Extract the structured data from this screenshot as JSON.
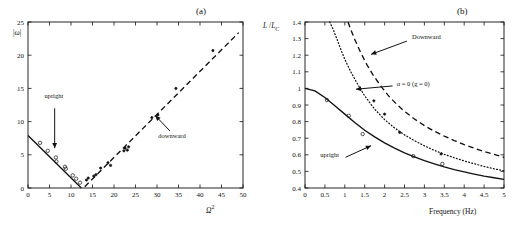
{
  "figure": {
    "panels": [
      {
        "id": "a",
        "label": "(a)",
        "chart_data": {
          "type": "scatter",
          "title": "",
          "xlabel": "Ω²",
          "ylabel": "|ω|",
          "xlim": [
            0,
            50
          ],
          "ylim": [
            0,
            25
          ],
          "xticks": [
            0,
            5,
            10,
            15,
            20,
            25,
            30,
            35,
            40,
            45,
            50
          ],
          "yticks": [
            0,
            5,
            10,
            15,
            20,
            25
          ],
          "grid": false,
          "legend": "none",
          "annotations": [
            {
              "text": "upright",
              "x": 6.0,
              "y": 13.5
            },
            {
              "text": "downward",
              "x": 33.5,
              "y": 7.5
            }
          ],
          "series": [
            {
              "name": "upright-fit",
              "style": "solid-line",
              "x": [
                0.0,
                12.4
              ],
              "values": [
                7.9,
                0.0
              ]
            },
            {
              "name": "downward-fit",
              "style": "dashed-line",
              "x": [
                13.2,
                49.0
              ],
              "values": [
                0.2,
                23.4
              ]
            },
            {
              "name": "upright-data",
              "style": "open-circle",
              "x": [
                2.8,
                4.6,
                6.5,
                6.6,
                8.6,
                8.8,
                10.4,
                11.2,
                12.1
              ],
              "values": [
                6.8,
                5.6,
                4.6,
                4.0,
                3.2,
                2.9,
                1.9,
                1.4,
                0.8
              ]
            },
            {
              "name": "downward-data",
              "style": "filled-dot",
              "x": [
                13.6,
                14.0,
                15.3,
                15.8,
                16.9,
                18.6,
                19.2,
                22.3,
                22.6,
                23.1,
                23.4,
                28.8,
                30.2,
                34.4,
                43.0
              ],
              "values": [
                1.2,
                1.5,
                1.8,
                2.0,
                3.0,
                3.8,
                3.4,
                5.6,
                6.0,
                5.7,
                6.2,
                10.6,
                11.0,
                15.0,
                20.7
              ]
            }
          ]
        }
      },
      {
        "id": "b",
        "label": "(b)",
        "chart_data": {
          "type": "line",
          "title": "",
          "xlabel": "Frequency (Hz)",
          "ylabel": "L /L_C",
          "xlim": [
            0,
            5
          ],
          "ylim": [
            0.4,
            1.4
          ],
          "xticks": [
            0,
            0.5,
            1,
            1.5,
            2,
            2.5,
            3,
            3.5,
            4,
            4.5,
            5
          ],
          "yticks": [
            0.4,
            0.5,
            0.6,
            0.7,
            0.8,
            0.9,
            1,
            1.1,
            1.2,
            1.3,
            1.4
          ],
          "grid": false,
          "legend": "none",
          "annotations": [
            {
              "text": "Downward",
              "x": 3.05,
              "y": 1.295
            },
            {
              "text": "α = 0 (g = 0)",
              "x": 2.72,
              "y": 1.015
            },
            {
              "text": "upright",
              "x": 0.62,
              "y": 0.585
            }
          ],
          "series": [
            {
              "name": "upright",
              "style": "solid-line",
              "x": [
                0,
                0.25,
                0.5,
                0.75,
                1,
                1.25,
                1.5,
                1.75,
                2,
                2.25,
                2.5,
                2.75,
                3,
                3.25,
                3.5,
                3.75,
                4,
                4.25,
                4.5,
                4.75,
                5
              ],
              "values": [
                1.0,
                0.985,
                0.945,
                0.895,
                0.845,
                0.795,
                0.748,
                0.708,
                0.672,
                0.64,
                0.612,
                0.588,
                0.565,
                0.545,
                0.527,
                0.511,
                0.497,
                0.484,
                0.472,
                0.462,
                0.452
              ]
            },
            {
              "name": "alpha-zero",
              "style": "dotted-line",
              "x": [
                0.62,
                0.7,
                0.8,
                0.9,
                1.0,
                1.15,
                1.3,
                1.5,
                1.75,
                2,
                2.25,
                2.5,
                2.75,
                3,
                3.25,
                3.5,
                3.75,
                4,
                4.25,
                4.5,
                4.75,
                5
              ],
              "values": [
                1.4,
                1.36,
                1.3,
                1.235,
                1.175,
                1.1,
                1.035,
                0.955,
                0.875,
                0.812,
                0.762,
                0.72,
                0.685,
                0.654,
                0.627,
                0.603,
                0.582,
                0.563,
                0.546,
                0.53,
                0.516,
                0.503
              ]
            },
            {
              "name": "downward",
              "style": "dashed-line",
              "x": [
                1.08,
                1.15,
                1.25,
                1.4,
                1.55,
                1.7,
                1.9,
                2.1,
                2.3,
                2.5,
                2.75,
                3,
                3.25,
                3.5,
                3.75,
                4,
                4.25,
                4.5,
                4.75,
                5
              ],
              "values": [
                1.4,
                1.355,
                1.295,
                1.215,
                1.145,
                1.085,
                1.015,
                0.955,
                0.905,
                0.862,
                0.816,
                0.776,
                0.742,
                0.712,
                0.686,
                0.662,
                0.64,
                0.62,
                0.602,
                0.585
              ]
            },
            {
              "name": "upright-data",
              "style": "open-circle",
              "x": [
                0.55,
                1.1,
                1.45,
                2.72,
                3.45
              ],
              "values": [
                0.93,
                0.835,
                0.725,
                0.592,
                0.545
              ]
            },
            {
              "name": "downward-data",
              "style": "filled-dot",
              "x": [
                1.73,
                2.0,
                2.38,
                3.42
              ],
              "values": [
                0.925,
                0.845,
                0.735,
                0.605
              ]
            }
          ]
        }
      }
    ]
  }
}
